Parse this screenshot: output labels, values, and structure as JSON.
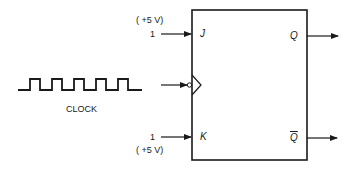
{
  "diagram": {
    "type": "JK flip-flop",
    "inputs": {
      "j": {
        "pin_label": "J",
        "value": "1",
        "voltage": "( +5 V)"
      },
      "k": {
        "pin_label": "K",
        "value": "1",
        "voltage": "( +5 V)"
      },
      "clock": {
        "label": "CLOCK",
        "edge": "negative-edge (bubble on clock input)"
      }
    },
    "outputs": {
      "q": {
        "pin_label": "Q"
      },
      "q_bar": {
        "pin_label": "Q"
      }
    },
    "colors": {
      "stroke": "#1a1a1a",
      "background": "#ffffff"
    }
  }
}
